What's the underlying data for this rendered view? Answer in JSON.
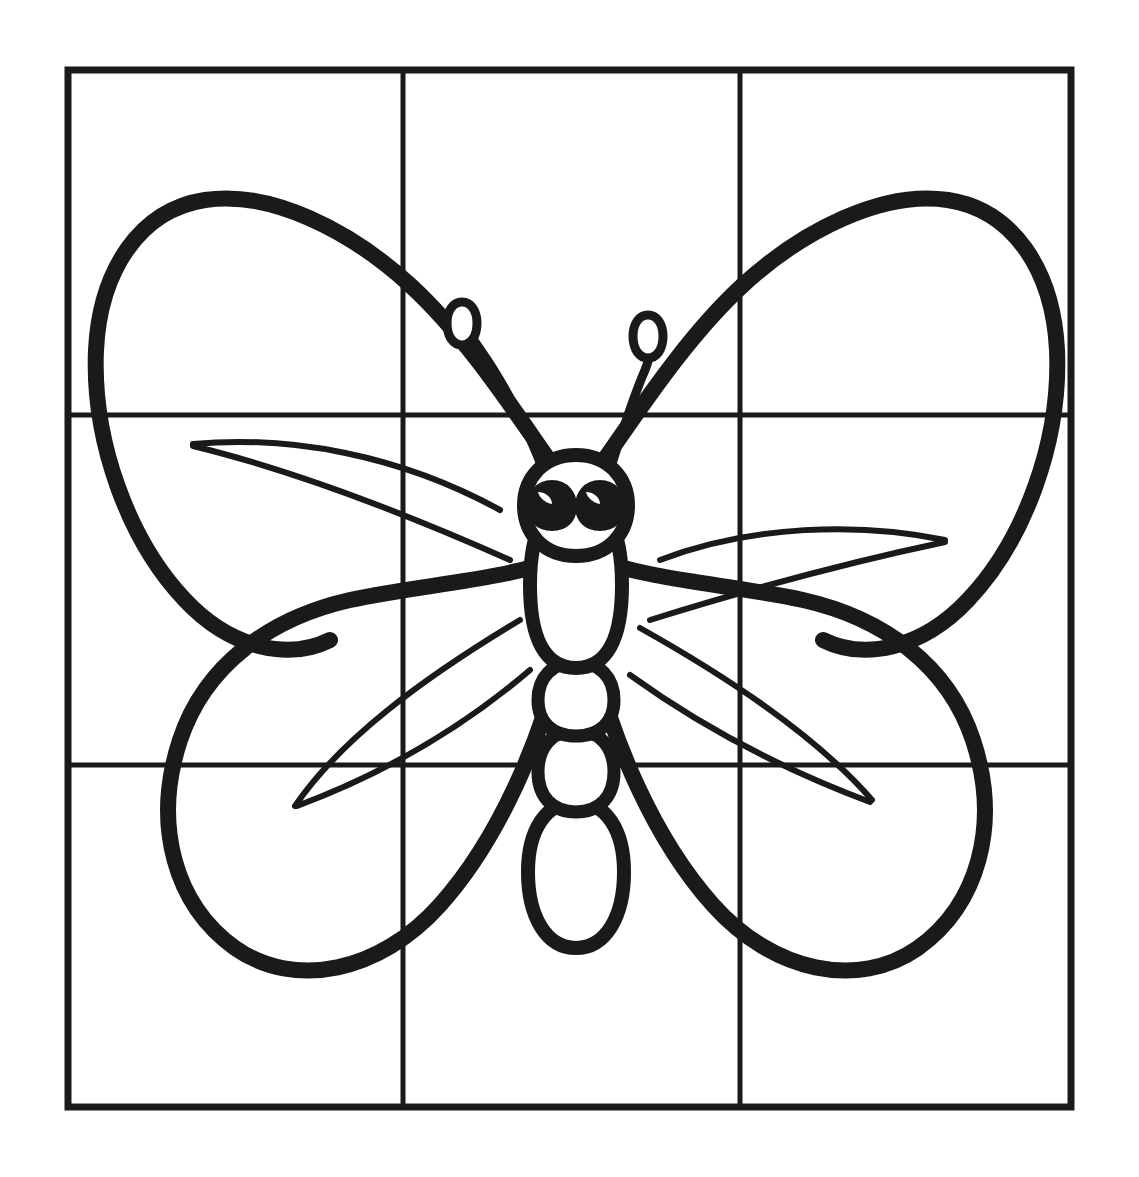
{
  "document": {
    "kind": "line-art-coloring-page",
    "subject": "butterfly",
    "title": "Butterfly line drawing with 3x3 proportion grid",
    "background_color": "#ffffff",
    "ink_color": "#1a1a1a",
    "canvas": {
      "width": 1139,
      "height": 1177
    }
  },
  "grid": {
    "name": "proportion-grid",
    "rows": 3,
    "columns": 3,
    "frame": {
      "x": 68,
      "y": 70,
      "width": 1003,
      "height": 1037
    },
    "border_color": "#1a1a1a",
    "border_width": 7,
    "inner_line_color": "#1a1a1a",
    "inner_line_width": 5,
    "vertical_lines_x": [
      403,
      740
    ],
    "horizontal_lines_y": [
      415,
      765
    ]
  },
  "drawing": {
    "stroke_color": "#1a1a1a",
    "outline_width": 16,
    "vein_width": 6,
    "fill_color": "#ffffff",
    "parts": [
      {
        "name": "upper-left-wing",
        "label": "Upper left wing"
      },
      {
        "name": "upper-right-wing",
        "label": "Upper right wing"
      },
      {
        "name": "lower-left-wing",
        "label": "Lower left wing"
      },
      {
        "name": "lower-right-wing",
        "label": "Lower right wing"
      },
      {
        "name": "body",
        "label": "Segmented body"
      },
      {
        "name": "head",
        "label": "Head"
      },
      {
        "name": "left-eye",
        "label": "Left eye"
      },
      {
        "name": "right-eye",
        "label": "Right eye"
      },
      {
        "name": "left-antenna",
        "label": "Left antenna"
      },
      {
        "name": "right-antenna",
        "label": "Right antenna"
      },
      {
        "name": "wing-veins",
        "label": "Wing vein lines"
      }
    ]
  },
  "paths": {
    "upper_left_wing": "M 556 470 C 520 420 470 340 410 285 C 350 230 270 190 205 200 C 140 210 100 270 96 350 C 92 440 128 540 185 600 C 232 650 290 660 330 640",
    "upper_right_wing": "M 597 470 C 633 420 683 340 743 285 C 803 230 883 190 948 200 C 1013 210 1053 270 1057 350 C 1061 440 1025 540 968 600 C 921 650 863 660 823 640",
    "lower_left_wing": "M 556 560 C 500 580 420 585 350 600 C 270 618 205 665 180 740 C 152 825 175 905 235 948 C 295 990 380 972 440 905 C 500 838 540 740 560 660",
    "lower_right_wing": "M 597 560 C 653 580 733 585 803 600 C 883 618 948 665 973 740 C 1001 825 978 905 918 948 C 858 990 773 972 713 905 C 653 838 613 740 593 660",
    "body_thorax": "M 576 500 C 606 500 622 530 622 585 C 622 640 606 668 576 668 C 546 668 530 640 530 585 C 530 530 546 500 576 500 Z",
    "body_seg2": "M 576 662 C 600 662 614 678 614 700 C 614 722 600 736 576 736 C 552 736 538 722 538 700 C 538 678 552 662 576 662 Z",
    "body_seg3": "M 576 730 C 600 730 614 748 614 772 C 614 796 600 812 576 812 C 552 812 538 796 538 772 C 538 748 552 730 576 730 Z",
    "body_abdomen": "M 576 802 C 606 802 624 830 624 872 C 624 916 606 948 576 948 C 546 948 528 916 528 872 C 528 830 546 802 576 802 Z",
    "head": "M 576 455 C 608 455 628 478 628 505 C 628 534 608 556 576 556 C 544 556 524 534 524 505 C 524 478 544 455 576 455 Z",
    "left_eye": "M 552 483 C 566 483 574 494 574 506 C 574 519 566 528 552 528 C 538 528 530 519 530 506 C 530 494 538 483 552 483 Z",
    "right_eye": "M 600 483 C 614 483 622 494 622 506 C 622 519 614 528 600 528 C 586 528 578 519 578 506 C 578 494 586 483 600 483 Z",
    "left_antenna": "M 543 470 C 528 430 505 385 482 352 C 473 338 466 330 462 325",
    "left_antenna_loop": "M 462 302 C 471 302 477 311 477 323 C 477 336 471 345 462 345 C 453 345 447 336 447 323 C 447 311 453 302 462 302 Z",
    "right_antenna": "M 610 470 C 622 432 632 400 645 370 C 649 360 650 355 650 350",
    "right_antenna_loop": "M 648 315 C 657 315 663 324 663 336 C 663 349 657 358 648 358 C 639 358 633 349 633 336 C 633 324 639 315 648 315 Z",
    "veins": [
      "M 193 444 C 290 435 400 455 500 510",
      "M 193 446 C 300 472 420 520 510 560",
      "M 295 806 C 340 740 420 680 520 620",
      "M 297 806 C 380 775 460 730 530 670",
      "M 945 540 C 860 522 750 525 660 560",
      "M 945 542 C 850 562 740 592 650 620",
      "M 872 800 C 820 740 740 684 640 628",
      "M 870 802 C 790 772 706 730 630 675"
    ]
  }
}
